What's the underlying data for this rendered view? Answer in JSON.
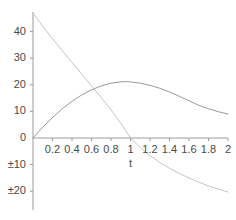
{
  "chart_data": {
    "type": "line",
    "title": "",
    "subtitle": "",
    "xlabel": "t",
    "ylabel": "",
    "xlim": [
      0,
      2
    ],
    "ylim": [
      -24,
      48
    ],
    "grid": false,
    "legend": null,
    "axis_origin": {
      "x": 0,
      "y": 0
    },
    "x_ticks": [
      {
        "value": 0.2,
        "label": "0.2"
      },
      {
        "value": 0.4,
        "label": "0.4"
      },
      {
        "value": 0.6,
        "label": "0.6"
      },
      {
        "value": 0.8,
        "label": "0.8"
      },
      {
        "value": 1.0,
        "label": "1"
      },
      {
        "value": 1.2,
        "label": "1.2"
      },
      {
        "value": 1.4,
        "label": "1.4"
      },
      {
        "value": 1.6,
        "label": "1.6"
      },
      {
        "value": 1.8,
        "label": "1.8"
      },
      {
        "value": 2.0,
        "label": "2"
      }
    ],
    "y_ticks": [
      {
        "value": 40,
        "label": "40"
      },
      {
        "value": 30,
        "label": "30"
      },
      {
        "value": 20,
        "label": "20"
      },
      {
        "value": 10,
        "label": "10"
      },
      {
        "value": 0,
        "label": "0"
      },
      {
        "value": -10,
        "label": "±10"
      },
      {
        "value": -20,
        "label": "±20"
      }
    ],
    "series": [
      {
        "name": "rising-arc",
        "color": "#9a9a9a",
        "points": [
          {
            "x": 0.0,
            "y": 0.0
          },
          {
            "x": 0.1,
            "y": 4.1
          },
          {
            "x": 0.2,
            "y": 7.7
          },
          {
            "x": 0.3,
            "y": 11.0
          },
          {
            "x": 0.4,
            "y": 13.8
          },
          {
            "x": 0.5,
            "y": 16.2
          },
          {
            "x": 0.6,
            "y": 18.1
          },
          {
            "x": 0.7,
            "y": 19.6
          },
          {
            "x": 0.8,
            "y": 20.6
          },
          {
            "x": 0.9,
            "y": 21.1
          },
          {
            "x": 0.95,
            "y": 21.2
          },
          {
            "x": 1.0,
            "y": 21.1
          },
          {
            "x": 1.1,
            "y": 20.6
          },
          {
            "x": 1.2,
            "y": 19.8
          },
          {
            "x": 1.3,
            "y": 18.7
          },
          {
            "x": 1.4,
            "y": 17.3
          },
          {
            "x": 1.5,
            "y": 15.7
          },
          {
            "x": 1.6,
            "y": 14.0
          },
          {
            "x": 1.7,
            "y": 12.3
          },
          {
            "x": 1.8,
            "y": 11.0
          },
          {
            "x": 1.9,
            "y": 9.9
          },
          {
            "x": 2.0,
            "y": 9.0
          }
        ]
      },
      {
        "name": "descending-curve",
        "color": "#c4c4c4",
        "points": [
          {
            "x": 0.0,
            "y": 47.0
          },
          {
            "x": 0.1,
            "y": 42.0
          },
          {
            "x": 0.2,
            "y": 37.3
          },
          {
            "x": 0.3,
            "y": 32.8
          },
          {
            "x": 0.4,
            "y": 28.4
          },
          {
            "x": 0.5,
            "y": 24.0
          },
          {
            "x": 0.6,
            "y": 19.6
          },
          {
            "x": 0.7,
            "y": 15.2
          },
          {
            "x": 0.8,
            "y": 10.6
          },
          {
            "x": 0.9,
            "y": 5.6
          },
          {
            "x": 1.0,
            "y": 0.0
          },
          {
            "x": 1.1,
            "y": -3.6
          },
          {
            "x": 1.2,
            "y": -6.6
          },
          {
            "x": 1.3,
            "y": -9.2
          },
          {
            "x": 1.4,
            "y": -11.4
          },
          {
            "x": 1.5,
            "y": -13.3
          },
          {
            "x": 1.6,
            "y": -15.0
          },
          {
            "x": 1.7,
            "y": -16.6
          },
          {
            "x": 1.8,
            "y": -18.0
          },
          {
            "x": 1.9,
            "y": -19.2
          },
          {
            "x": 2.0,
            "y": -20.3
          }
        ]
      }
    ],
    "annotations": []
  },
  "style": {
    "axis_color": "#9b9b9b",
    "tick_color": "#9b9b9b",
    "text_color": "#4a4a4a",
    "background": "#ffffff"
  }
}
